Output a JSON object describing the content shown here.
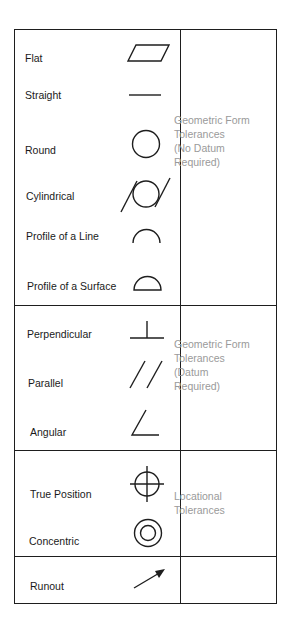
{
  "rows": [
    {
      "label": "Flat",
      "icon": "flatness-icon"
    },
    {
      "label": "Straight",
      "icon": "straightness-icon"
    },
    {
      "label": "Round",
      "icon": "circularity-icon"
    },
    {
      "label": "Cylindrical",
      "icon": "cylindricity-icon"
    },
    {
      "label": "Profile of a Line",
      "icon": "profile-line-icon"
    },
    {
      "label": "Profile of a Surface",
      "icon": "profile-surface-icon"
    },
    {
      "label": "Perpendicular",
      "icon": "perpendicularity-icon"
    },
    {
      "label": "Parallel",
      "icon": "parallelism-icon"
    },
    {
      "label": "Angular",
      "icon": "angularity-icon"
    },
    {
      "label": "True Position",
      "icon": "true-position-icon"
    },
    {
      "label": "Concentric",
      "icon": "concentricity-icon"
    },
    {
      "label": "Runout",
      "icon": "runout-icon"
    }
  ],
  "categories": [
    {
      "line1": "Geometric Form",
      "line2": "Tolerances",
      "line3": "(No Datum",
      "line4": "Required)"
    },
    {
      "line1": "Geometric Form",
      "line2": "Tolerances",
      "line3": "(Datum",
      "line4": "Required)"
    },
    {
      "line1": "Locational",
      "line2": "Tolerances"
    }
  ],
  "colors": {
    "line": "#1e1e1e",
    "category_text": "#9a9a9a"
  }
}
